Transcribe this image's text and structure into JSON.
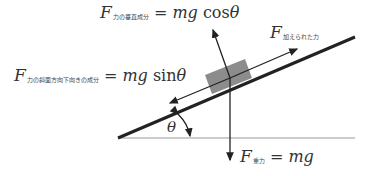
{
  "labels": {
    "normal": {
      "F": "F",
      "sub": "力の垂直成分",
      "eq": " = ",
      "rhs_m": "mg",
      "rhs_fn": " cos",
      "rhs_theta": "θ"
    },
    "applied": {
      "F": "F",
      "sub": "加えられた力"
    },
    "parallel": {
      "F": "F",
      "sub": "力の斜面方向下向きの成分",
      "eq": " = ",
      "rhs_m": "mg",
      "rhs_fn": " sin",
      "rhs_theta": "θ"
    },
    "gravity": {
      "F": "F",
      "sub": "重力",
      "eq": " = ",
      "rhs_m": "mg"
    },
    "angle": "θ"
  },
  "colors": {
    "line": "#222222",
    "ground": "#999999",
    "block": "#8c8c8c",
    "text": "#333333"
  }
}
